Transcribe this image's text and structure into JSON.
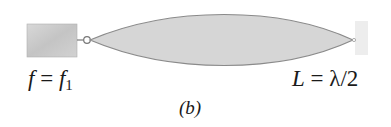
{
  "figure": {
    "panel_label": "(b)",
    "left_label": {
      "lhs": "f",
      "eq": " = ",
      "rhs": "f",
      "sub": "1"
    },
    "right_label": {
      "lhs": "L",
      "eq": " = ",
      "rhs": "λ/2"
    },
    "colors": {
      "oscillator_block": "#c9c9c9",
      "wall_block": "#ececec",
      "string_envelope_fill": "#d6d6d6",
      "string_envelope_stroke": "#8a8a8a"
    }
  }
}
